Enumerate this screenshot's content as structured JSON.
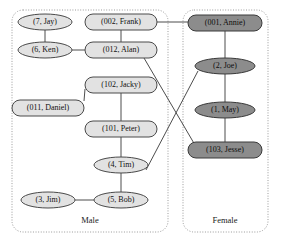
{
  "diagram": {
    "colors": {
      "male_fill": "#e2e2e2",
      "female_fill": "#8c8c8c",
      "node_stroke": "#4a4a4a",
      "edge": "#4d4d4d",
      "group_border": "#9a9a9a",
      "background": "#ffffff"
    },
    "groups": [
      {
        "id": "male",
        "label": "Male",
        "label_x": 90,
        "label_y": 221,
        "box": {
          "x": 12,
          "y": 10,
          "width": 156,
          "height": 222,
          "rx": 11
        }
      },
      {
        "id": "female",
        "label": "Female",
        "label_x": 225,
        "label_y": 221,
        "box": {
          "x": 183,
          "y": 10,
          "width": 85,
          "height": 222,
          "rx": 11
        }
      }
    ],
    "nodes": [
      {
        "id": "jay",
        "label": "(7, Jay)",
        "group": "male",
        "shape": "ellipse",
        "cx": 45,
        "cy": 22,
        "rx": 27,
        "ry": 8
      },
      {
        "id": "frank",
        "label": "(002, Frank)",
        "group": "male",
        "shape": "rect",
        "cx": 121,
        "cy": 22,
        "rx": 36,
        "ry": 8
      },
      {
        "id": "ken",
        "label": "(6, Ken)",
        "group": "male",
        "shape": "ellipse",
        "cx": 45,
        "cy": 50,
        "rx": 27,
        "ry": 8
      },
      {
        "id": "alan",
        "label": "(012, Alan)",
        "group": "male",
        "shape": "rect",
        "cx": 121,
        "cy": 50,
        "rx": 36,
        "ry": 8
      },
      {
        "id": "jacky",
        "label": "(102, Jacky)",
        "group": "male",
        "shape": "rect",
        "cx": 121,
        "cy": 85,
        "rx": 36,
        "ry": 8
      },
      {
        "id": "daniel",
        "label": "(011, Daniel)",
        "group": "male",
        "shape": "rect",
        "cx": 48,
        "cy": 108,
        "rx": 36,
        "ry": 8
      },
      {
        "id": "peter",
        "label": "(101, Peter)",
        "group": "male",
        "shape": "rect",
        "cx": 121,
        "cy": 129,
        "rx": 36,
        "ry": 8
      },
      {
        "id": "tim",
        "label": "(4, Tim)",
        "group": "male",
        "shape": "ellipse",
        "cx": 121,
        "cy": 165,
        "rx": 27,
        "ry": 8
      },
      {
        "id": "jim",
        "label": "(3, Jim)",
        "group": "male",
        "shape": "ellipse",
        "cx": 48,
        "cy": 200,
        "rx": 27,
        "ry": 8
      },
      {
        "id": "bob",
        "label": "(5, Bob)",
        "group": "male",
        "shape": "ellipse",
        "cx": 121,
        "cy": 200,
        "rx": 27,
        "ry": 8
      },
      {
        "id": "annie",
        "label": "(001, Annie)",
        "group": "female",
        "shape": "rect",
        "cx": 225,
        "cy": 23,
        "rx": 37,
        "ry": 8
      },
      {
        "id": "joe",
        "label": "(2, Joe)",
        "group": "female",
        "shape": "ellipse",
        "cx": 225,
        "cy": 66,
        "rx": 30,
        "ry": 8
      },
      {
        "id": "may",
        "label": "(1, May)",
        "group": "female",
        "shape": "ellipse",
        "cx": 225,
        "cy": 110,
        "rx": 30,
        "ry": 8
      },
      {
        "id": "jesse",
        "label": "(103, Jesse)",
        "group": "female",
        "shape": "rect",
        "cx": 225,
        "cy": 150,
        "rx": 37,
        "ry": 8
      }
    ],
    "edges": [
      {
        "id": "jay-ken",
        "from": "jay",
        "to": "ken",
        "x1": 45,
        "y1": 30,
        "x2": 45,
        "y2": 42
      },
      {
        "id": "ken-alan",
        "from": "ken",
        "to": "alan",
        "x1": 72,
        "y1": 50,
        "x2": 85,
        "y2": 50
      },
      {
        "id": "frank-alan",
        "from": "frank",
        "to": "alan",
        "x1": 121,
        "y1": 30,
        "x2": 121,
        "y2": 42
      },
      {
        "id": "jacky-daniel",
        "from": "jacky",
        "to": "daniel",
        "x1": 85,
        "y1": 89,
        "x2": 84,
        "y2": 101
      },
      {
        "id": "jacky-peter",
        "from": "jacky",
        "to": "peter",
        "x1": 121,
        "y1": 93,
        "x2": 121,
        "y2": 121
      },
      {
        "id": "peter-tim",
        "from": "peter",
        "to": "tim",
        "x1": 121,
        "y1": 137,
        "x2": 121,
        "y2": 157
      },
      {
        "id": "tim-bob",
        "from": "tim",
        "to": "bob",
        "x1": 121,
        "y1": 173,
        "x2": 121,
        "y2": 192
      },
      {
        "id": "jim-bob",
        "from": "jim",
        "to": "bob",
        "x1": 75,
        "y1": 200,
        "x2": 94,
        "y2": 200
      },
      {
        "id": "frank-annie",
        "from": "frank",
        "to": "annie",
        "x1": 157,
        "y1": 22,
        "x2": 188,
        "y2": 22
      },
      {
        "id": "annie-joe",
        "from": "annie",
        "to": "joe",
        "x1": 225,
        "y1": 31,
        "x2": 225,
        "y2": 58
      },
      {
        "id": "joe-may",
        "from": "joe",
        "to": "may",
        "x1": 225,
        "y1": 74,
        "x2": 225,
        "y2": 102
      },
      {
        "id": "may-jesse",
        "from": "may",
        "to": "jesse",
        "x1": 225,
        "y1": 118,
        "x2": 225,
        "y2": 142
      },
      {
        "id": "alan-jesse",
        "from": "alan",
        "to": "jesse",
        "x1": 144,
        "y1": 58,
        "x2": 195,
        "y2": 145
      },
      {
        "id": "tim-joe",
        "from": "tim",
        "to": "joe",
        "x1": 146,
        "y1": 170,
        "x2": 198,
        "y2": 71
      }
    ]
  }
}
